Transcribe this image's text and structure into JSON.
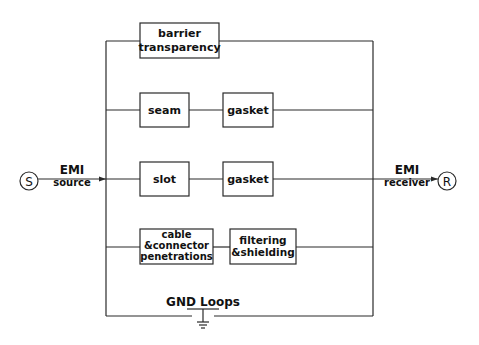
{
  "diagram": {
    "type": "EMI coupling paths block diagram",
    "source": {
      "circle_label": "S",
      "title": "EMI",
      "subtitle": "source"
    },
    "receiver": {
      "circle_label": "R",
      "title": "EMI",
      "subtitle": "receiver"
    },
    "branches": [
      {
        "blocks": [
          {
            "lines": [
              "barrier",
              "transparency"
            ]
          }
        ]
      },
      {
        "blocks": [
          {
            "lines": [
              "seam"
            ]
          },
          {
            "lines": [
              "gasket"
            ]
          }
        ]
      },
      {
        "blocks": [
          {
            "lines": [
              "slot"
            ]
          },
          {
            "lines": [
              "gasket"
            ]
          }
        ]
      },
      {
        "blocks": [
          {
            "lines": [
              "cable",
              "&connector",
              "penetrations"
            ]
          },
          {
            "lines": [
              "filtering",
              "&shielding"
            ]
          }
        ]
      }
    ],
    "ground": {
      "label": "GND Loops"
    },
    "colors": {
      "line": "#2a2a2a",
      "text": "#111111",
      "background": "#ffffff"
    }
  }
}
